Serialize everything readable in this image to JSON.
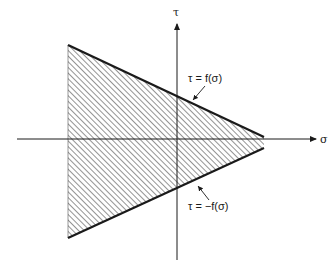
{
  "diagram": {
    "type": "stress-space failure region",
    "axes": {
      "horizontal": {
        "label": "σ",
        "from": [
          17,
          139
        ],
        "to": [
          318,
          139
        ]
      },
      "vertical": {
        "label": "τ",
        "from": [
          177,
          260
        ],
        "to": [
          177,
          22
        ]
      }
    },
    "region": {
      "description": "hatched wedge bounded by τ = f(σ) above and τ = −f(σ) below",
      "vertices": [
        [
          68,
          45
        ],
        [
          264,
          137
        ],
        [
          264,
          148
        ],
        [
          68,
          238
        ]
      ],
      "hatch": "diagonal"
    },
    "curves": [
      {
        "name": "upper",
        "label": "τ = f(σ)",
        "from": [
          68,
          45
        ],
        "to": [
          264,
          137
        ]
      },
      {
        "name": "lower",
        "label": "τ = −f(σ)",
        "from": [
          68,
          238
        ],
        "to": [
          264,
          148
        ]
      }
    ],
    "labels": {
      "tau_axis": "τ",
      "sigma_axis": "σ",
      "upper_curve": "τ = f(σ)",
      "lower_curve": "τ = −f(σ)"
    },
    "colors": {
      "line": "#1a1a1a",
      "hatch": "#3a3a3a",
      "background": "#ffffff"
    }
  }
}
